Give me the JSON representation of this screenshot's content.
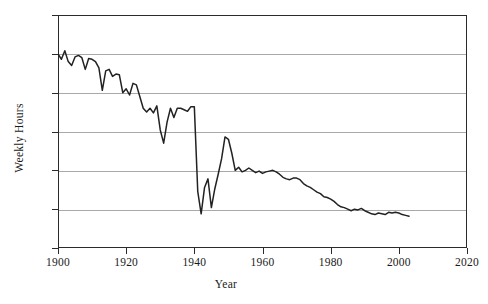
{
  "chart_data": {
    "type": "line",
    "title": "",
    "xlabel": "Year",
    "ylabel": "Weekly Hours",
    "xlim": [
      1900,
      2020
    ],
    "ylim": [
      30,
      60
    ],
    "xticks": [
      1900,
      1920,
      1940,
      1960,
      1980,
      2000,
      2020
    ],
    "yticks": [
      30,
      35,
      40,
      45,
      50,
      55,
      60
    ],
    "grid": true,
    "legend": false,
    "line_color": "#222222",
    "gridline_color": "#a9a9a9",
    "axis_color": "#2b2b2b",
    "series": [
      {
        "name": "Average Weekly Hours",
        "x": [
          1900,
          1901,
          1902,
          1903,
          1904,
          1905,
          1906,
          1907,
          1908,
          1909,
          1910,
          1911,
          1912,
          1913,
          1914,
          1915,
          1916,
          1917,
          1918,
          1919,
          1920,
          1921,
          1922,
          1923,
          1924,
          1925,
          1926,
          1927,
          1928,
          1929,
          1930,
          1931,
          1932,
          1933,
          1934,
          1935,
          1936,
          1937,
          1938,
          1939,
          1940,
          1941,
          1942,
          1943,
          1944,
          1945,
          1946,
          1947,
          1948,
          1949,
          1950,
          1951,
          1952,
          1953,
          1954,
          1955,
          1956,
          1957,
          1958,
          1959,
          1960,
          1961,
          1962,
          1963,
          1964,
          1965,
          1966,
          1967,
          1968,
          1969,
          1970,
          1971,
          1972,
          1973,
          1974,
          1975,
          1976,
          1977,
          1978,
          1979,
          1980,
          1981,
          1982,
          1983,
          1984,
          1985,
          1986,
          1987,
          1988,
          1989,
          1990,
          1991,
          1992,
          1993,
          1994,
          1995,
          1996,
          1997,
          1998,
          1999,
          2000,
          2001,
          2002,
          2003
        ],
        "values": [
          55.0,
          54.3,
          55.4,
          54.0,
          53.5,
          54.6,
          54.8,
          54.5,
          53.0,
          54.4,
          54.3,
          54.0,
          53.2,
          50.3,
          52.8,
          53.0,
          52.1,
          52.4,
          52.3,
          50.0,
          50.5,
          49.7,
          51.2,
          51.0,
          49.5,
          48.0,
          47.5,
          48.0,
          47.4,
          48.3,
          45.2,
          43.5,
          46.2,
          48.0,
          46.8,
          48.0,
          48.0,
          47.8,
          47.6,
          48.2,
          48.2,
          37.3,
          34.4,
          37.8,
          38.9,
          35.2,
          37.6,
          39.5,
          41.5,
          44.3,
          44.0,
          42.2,
          40.0,
          40.4,
          39.8,
          40.0,
          40.3,
          40.0,
          39.7,
          39.9,
          39.6,
          39.8,
          39.9,
          40.0,
          39.8,
          39.5,
          39.1,
          38.9,
          38.8,
          39.0,
          39.0,
          38.8,
          38.3,
          38.0,
          37.8,
          37.5,
          37.2,
          37.0,
          36.6,
          36.5,
          36.3,
          36.0,
          35.6,
          35.3,
          35.2,
          35.0,
          34.8,
          35.0,
          34.9,
          35.1,
          34.8,
          34.6,
          34.4,
          34.3,
          34.5,
          34.4,
          34.3,
          34.6,
          34.5,
          34.6,
          34.5,
          34.3,
          34.2,
          34.1
        ]
      }
    ]
  },
  "axis": {
    "y_tick_labels": [
      "60",
      "55",
      "50",
      "45",
      "40",
      "35",
      "30"
    ],
    "x_tick_labels": [
      "1900",
      "1920",
      "1940",
      "1960",
      "1980",
      "2000",
      "2020"
    ],
    "y_title": "Weekly Hours",
    "x_title": "Year"
  }
}
